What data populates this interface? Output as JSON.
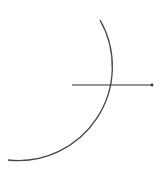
{
  "diagram": {
    "width": 162,
    "height": 177,
    "background": "#ffffff",
    "arc": {
      "start": [
        100,
        20
      ],
      "end": [
        8,
        160
      ],
      "radius": 94,
      "stroke": "#444444",
      "stroke_width": 1.3
    },
    "ray": {
      "start": [
        72,
        85
      ],
      "end": [
        152,
        85
      ],
      "stroke": "#333333",
      "stroke_width": 1.2,
      "endpoint_dot_radius": 1.4
    }
  }
}
